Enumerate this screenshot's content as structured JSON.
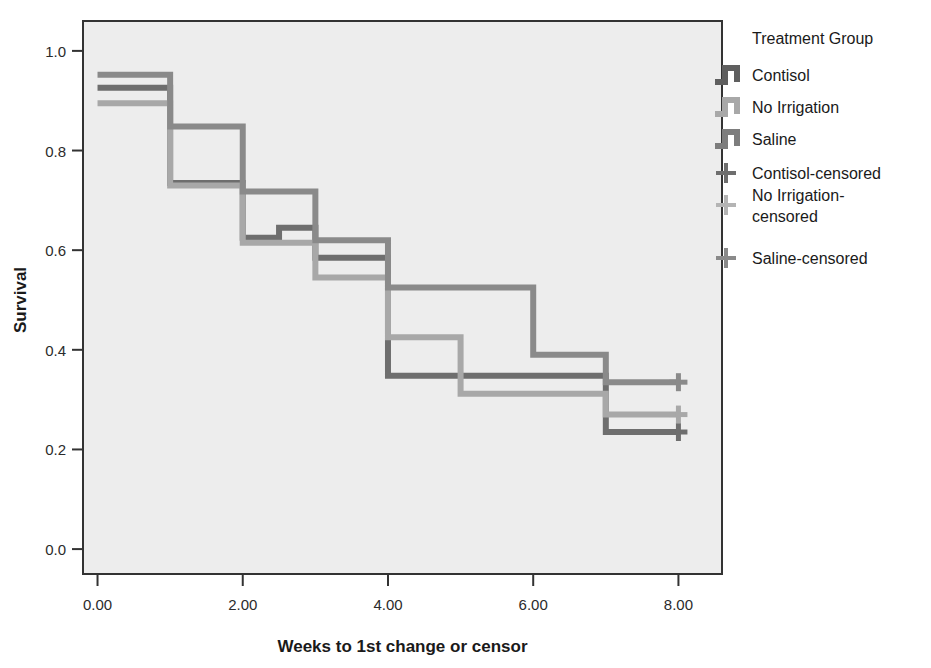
{
  "chart_data": {
    "type": "line",
    "subtype": "kaplan-meier-survival-step",
    "title": "",
    "xlabel": "Weeks to 1st change or censor",
    "ylabel": "Survival",
    "xlim": [
      -0.2,
      8.6
    ],
    "ylim": [
      -0.05,
      1.06
    ],
    "xticks": [
      0,
      2,
      4,
      6,
      8
    ],
    "xtick_labels": [
      "0.00",
      "2.00",
      "4.00",
      "6.00",
      "8.00"
    ],
    "yticks": [
      0.0,
      0.2,
      0.4,
      0.6,
      0.8,
      1.0
    ],
    "ytick_labels": [
      "0.0",
      "0.2",
      "0.4",
      "0.6",
      "0.8",
      "1.0"
    ],
    "grid": false,
    "legend_position": "right",
    "legend_title": "Treatment Group",
    "plot_background": "#ededed",
    "series": [
      {
        "name": "Contisol",
        "color": "#6e6e6e",
        "steps": [
          [
            0.0,
            0.926
          ],
          [
            1.0,
            0.735
          ],
          [
            2.0,
            0.625
          ],
          [
            2.5,
            0.645
          ],
          [
            3.0,
            0.585
          ],
          [
            4.0,
            0.348
          ],
          [
            5.0,
            0.348
          ],
          [
            7.0,
            0.235
          ],
          [
            8.0,
            0.235
          ]
        ],
        "censored_points": [
          [
            8.0,
            0.235
          ]
        ]
      },
      {
        "name": "No Irrigation",
        "color": "#a8a8a8",
        "steps": [
          [
            0.0,
            0.895
          ],
          [
            1.0,
            0.73
          ],
          [
            2.0,
            0.615
          ],
          [
            3.0,
            0.545
          ],
          [
            4.0,
            0.425
          ],
          [
            5.0,
            0.425
          ],
          [
            5.0,
            0.312
          ],
          [
            6.0,
            0.312
          ],
          [
            7.0,
            0.27
          ],
          [
            8.0,
            0.27
          ]
        ],
        "censored_points": [
          [
            8.0,
            0.27
          ]
        ]
      },
      {
        "name": "Saline",
        "color": "#8a8a8a",
        "steps": [
          [
            0.0,
            0.952
          ],
          [
            1.0,
            0.848
          ],
          [
            2.0,
            0.848
          ],
          [
            2.0,
            0.718
          ],
          [
            3.0,
            0.718
          ],
          [
            3.0,
            0.62
          ],
          [
            4.0,
            0.62
          ],
          [
            4.0,
            0.525
          ],
          [
            5.0,
            0.525
          ],
          [
            6.0,
            0.39
          ],
          [
            7.0,
            0.335
          ],
          [
            8.0,
            0.335
          ]
        ],
        "censored_points": [
          [
            8.0,
            0.335
          ]
        ]
      }
    ]
  },
  "legend": {
    "title": "Treatment Group",
    "entries": [
      {
        "label": "Contisol",
        "marker": "step-swatch",
        "color": "#5f5f5f"
      },
      {
        "label": "No Irrigation",
        "marker": "step-swatch",
        "color": "#a8a8a8"
      },
      {
        "label": "Saline",
        "marker": "step-swatch",
        "color": "#7d7d7d"
      },
      {
        "label": "Contisol-censored",
        "marker": "plus-icon",
        "color": "#6e6e6e"
      },
      {
        "label": "No Irrigation-censored",
        "marker": "plus-icon",
        "color": "#b4b4b4"
      },
      {
        "label": "Saline-censored",
        "marker": "plus-icon",
        "color": "#8a8a8a"
      }
    ]
  },
  "axes": {
    "x_title": "Weeks to 1st change or censor",
    "y_title": "Survival"
  }
}
